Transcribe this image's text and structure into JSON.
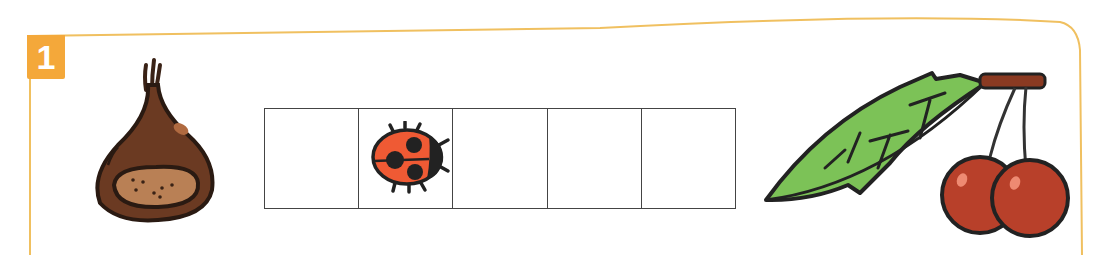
{
  "exercise": {
    "number": "1",
    "badge_color": "#f4a83a",
    "frame_color": "#f0c060"
  },
  "items": [
    {
      "name": "chestnut",
      "icon": "chestnut-icon"
    },
    {
      "name": "cherries-with-leaf",
      "icon": "cherries-icon"
    }
  ],
  "sequence_grid": {
    "cells": [
      {
        "index": 1,
        "content": ""
      },
      {
        "index": 2,
        "content": "ladybug-icon"
      },
      {
        "index": 3,
        "content": ""
      },
      {
        "index": 4,
        "content": ""
      },
      {
        "index": 5,
        "content": ""
      }
    ]
  }
}
